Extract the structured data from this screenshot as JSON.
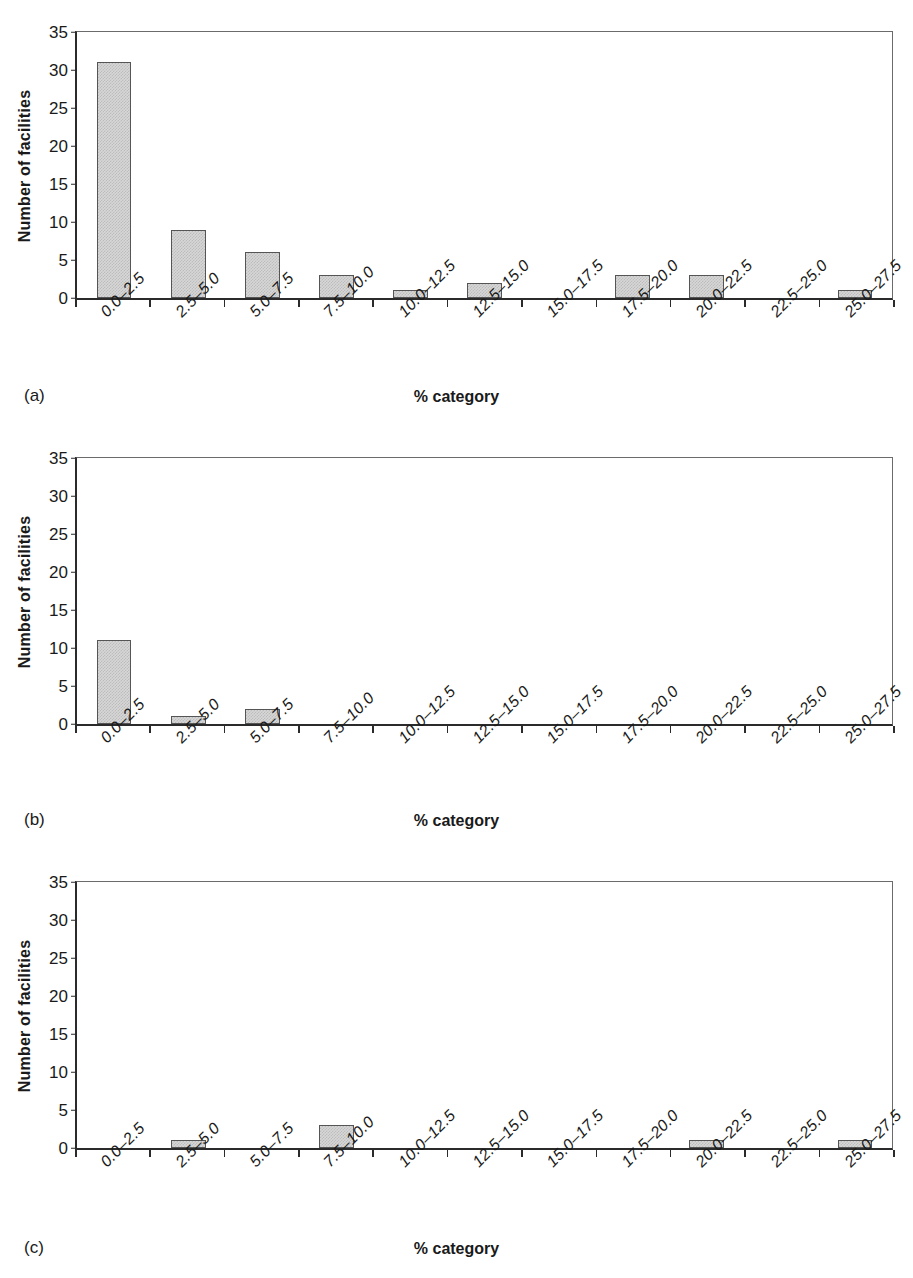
{
  "figure": {
    "background": "#ffffff",
    "bar_fill": "#d7d7d7",
    "bar_border": "#555555",
    "axis_color": "#2b2b2b"
  },
  "axis": {
    "ylabel": "Number of facilities",
    "xlabel": "% category",
    "yticks": [
      "0",
      "5",
      "10",
      "15",
      "20",
      "25",
      "30",
      "35"
    ],
    "ymin": 0,
    "ymax": 35,
    "ystep": 5
  },
  "categories": [
    "0.0–2.5",
    "2.5–5.0",
    "5.0–7.5",
    "7.5–10.0",
    "10.0–12.5",
    "12.5–15.0",
    "15.0–17.5",
    "17.5–20.0",
    "20.0–22.5",
    "22.5–25.0",
    "25.0–27.5"
  ],
  "panels": [
    {
      "letter": "(a)",
      "values": [
        31,
        9,
        6,
        3,
        1,
        2,
        0,
        3,
        3,
        0,
        1
      ]
    },
    {
      "letter": "(b)",
      "values": [
        11,
        1,
        2,
        0,
        0,
        0,
        0,
        0,
        0,
        0,
        0
      ]
    },
    {
      "letter": "(c)",
      "values": [
        0,
        1,
        0,
        3,
        0,
        0,
        0,
        0,
        1,
        0,
        1
      ]
    }
  ],
  "chart_data": {
    "type": "bar",
    "title": "",
    "subtitle": "",
    "xlabel": "% category",
    "ylabel": "Number of facilities",
    "ylim": [
      0,
      35
    ],
    "ytick_values": [
      0,
      5,
      10,
      15,
      20,
      25,
      30,
      35
    ],
    "grid": false,
    "legend": false,
    "legend_position": "none",
    "categories": [
      "0.0–2.5",
      "2.5–5.0",
      "5.0–7.5",
      "7.5–10.0",
      "10.0–12.5",
      "12.5–15.0",
      "15.0–17.5",
      "17.5–20.0",
      "20.0–22.5",
      "22.5–25.0",
      "25.0–27.5"
    ],
    "series": [
      {
        "name": "(a)",
        "values": [
          31,
          9,
          6,
          3,
          1,
          2,
          0,
          3,
          3,
          0,
          1
        ]
      },
      {
        "name": "(b)",
        "values": [
          11,
          1,
          2,
          0,
          0,
          0,
          0,
          0,
          0,
          0,
          0
        ]
      },
      {
        "name": "(c)",
        "values": [
          0,
          1,
          0,
          3,
          0,
          0,
          0,
          0,
          1,
          0,
          1
        ]
      }
    ],
    "annotations": [
      "(a)",
      "(b)",
      "(c)"
    ]
  }
}
